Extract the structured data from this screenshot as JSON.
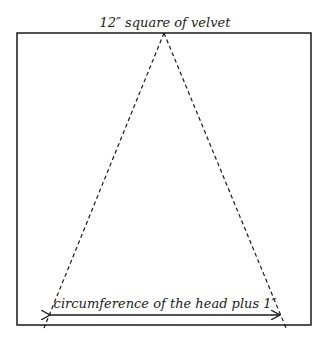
{
  "diagram": {
    "title_label": "12″ square of velvet",
    "base_label": "circumference of the head plus 1″",
    "colors": {
      "line": "#1a1a1a",
      "background": "#ffffff"
    }
  }
}
